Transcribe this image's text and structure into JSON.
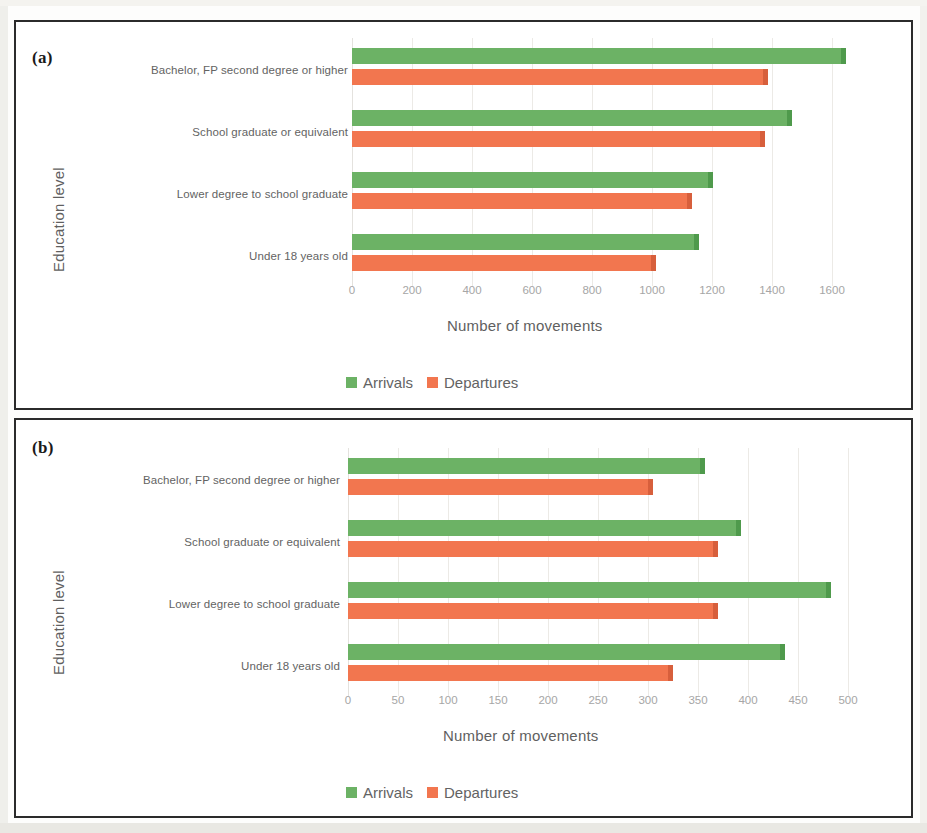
{
  "figure": {
    "panels": [
      {
        "tag": "(a)",
        "y_axis_title": "Education level",
        "x_axis_title": "Number of movements",
        "legend": [
          {
            "label": "Arrivals",
            "color": "#6cb265",
            "icon": "legend-swatch-green"
          },
          {
            "label": "Departures",
            "color": "#f2764f",
            "icon": "legend-swatch-orange"
          }
        ]
      },
      {
        "tag": "(b)",
        "y_axis_title": "Education level",
        "x_axis_title": "Number of movements",
        "legend": [
          {
            "label": "Arrivals",
            "color": "#6cb265",
            "icon": "legend-swatch-green"
          },
          {
            "label": "Departures",
            "color": "#f2764f",
            "icon": "legend-swatch-orange"
          }
        ]
      }
    ]
  },
  "chart_data": [
    {
      "type": "bar",
      "orientation": "horizontal",
      "panel": "(a)",
      "title": "",
      "xlabel": "Number of movements",
      "ylabel": "Education level",
      "categories": [
        "Bachelor, FP second degree or higher",
        "School graduate or equivalent",
        "Lower degree to school graduate",
        "Under 18 years old"
      ],
      "series": [
        {
          "name": "Arrivals",
          "color": "#6cb265",
          "values": [
            1630,
            1450,
            1185,
            1140
          ]
        },
        {
          "name": "Departures",
          "color": "#f2764f",
          "values": [
            1370,
            1360,
            1115,
            995
          ]
        }
      ],
      "xlim": [
        0,
        1700
      ],
      "xticks": [
        0,
        200,
        400,
        600,
        800,
        1000,
        1200,
        1400,
        1600
      ],
      "grid": true,
      "legend_position": "bottom"
    },
    {
      "type": "bar",
      "orientation": "horizontal",
      "panel": "(b)",
      "title": "",
      "xlabel": "Number of movements",
      "ylabel": "Education level",
      "categories": [
        "Bachelor, FP second degree or higher",
        "School graduate or equivalent",
        "Lower degree to school graduate",
        "Under 18 years old"
      ],
      "series": [
        {
          "name": "Arrivals",
          "color": "#6cb265",
          "values": [
            352,
            388,
            478,
            432
          ]
        },
        {
          "name": "Departures",
          "color": "#f2764f",
          "values": [
            300,
            365,
            365,
            320
          ]
        }
      ],
      "xlim": [
        0,
        520
      ],
      "xticks": [
        0,
        50,
        100,
        150,
        200,
        250,
        300,
        350,
        400,
        450,
        500
      ],
      "grid": true,
      "legend_position": "bottom"
    }
  ]
}
